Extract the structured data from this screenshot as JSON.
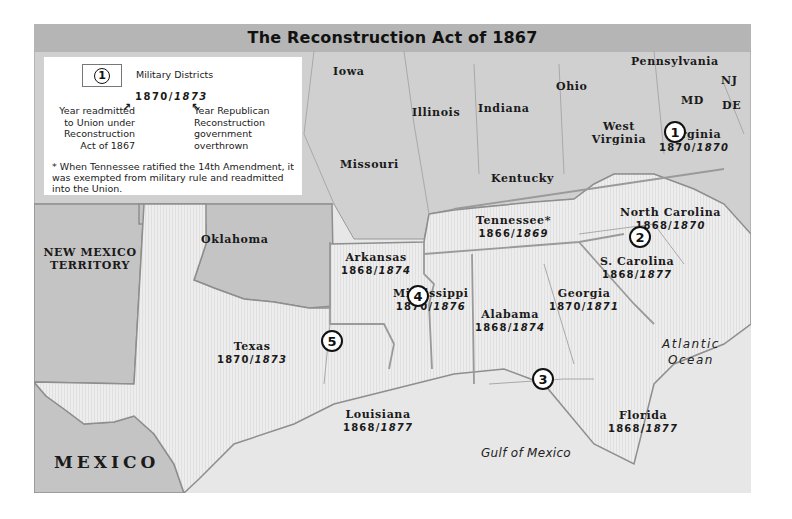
{
  "map": {
    "title": "The Reconstruction Act of 1867",
    "colors": {
      "title_bar": "#b5b5b5",
      "union_states": "#d0d0d0",
      "reconstruction_states": "#ececec",
      "territories_foreign": "#c4c4c4",
      "water": "#e7e7e7",
      "border": "#9a9a9a"
    }
  },
  "legend": {
    "district_symbol": "1",
    "district_label": "Military Districts",
    "sample_years": {
      "readmitted": "1870",
      "separator": "/",
      "overthrown": "1873"
    },
    "left_note": "Year readmitted to Union under Reconstruction Act of 1867",
    "right_note": "Year Republican Reconstruction government overthrown",
    "arrow_left": "↗",
    "arrow_right": "↖",
    "footnote": "* When Tennessee ratified the 14th Amendment, it was exempted from military rule and readmitted into the Union."
  },
  "union_states": [
    {
      "name": "Iowa"
    },
    {
      "name": "Illinois"
    },
    {
      "name": "Indiana"
    },
    {
      "name": "Ohio"
    },
    {
      "name": "Pennsylvania"
    },
    {
      "name": "NJ"
    },
    {
      "name": "MD"
    },
    {
      "name": "DE"
    },
    {
      "name": "West Virginia"
    },
    {
      "name": "Missouri"
    },
    {
      "name": "Kentucky"
    }
  ],
  "territories": [
    {
      "name": "NEW MEXICO TERRITORY"
    },
    {
      "name": "Oklahoma"
    },
    {
      "name": "MEXICO"
    }
  ],
  "reconstruction_states": [
    {
      "name": "Virginia",
      "readmitted": "1870",
      "overthrown": "1870"
    },
    {
      "name": "North Carolina",
      "readmitted": "1868",
      "overthrown": "1870"
    },
    {
      "name": "S. Carolina",
      "readmitted": "1868",
      "overthrown": "1877"
    },
    {
      "name": "Tennessee*",
      "readmitted": "1866",
      "overthrown": "1869"
    },
    {
      "name": "Georgia",
      "readmitted": "1870",
      "overthrown": "1871"
    },
    {
      "name": "Alabama",
      "readmitted": "1868",
      "overthrown": "1874"
    },
    {
      "name": "Mississippi",
      "readmitted": "1870",
      "overthrown": "1876"
    },
    {
      "name": "Arkansas",
      "readmitted": "1868",
      "overthrown": "1874"
    },
    {
      "name": "Texas",
      "readmitted": "1870",
      "overthrown": "1873"
    },
    {
      "name": "Louisiana",
      "readmitted": "1868",
      "overthrown": "1877"
    },
    {
      "name": "Florida",
      "readmitted": "1868",
      "overthrown": "1877"
    }
  ],
  "military_districts": [
    {
      "number": "1",
      "state": "Virginia"
    },
    {
      "number": "2",
      "state": "North Carolina / South Carolina"
    },
    {
      "number": "3",
      "state": "Georgia / Alabama / Florida"
    },
    {
      "number": "4",
      "state": "Mississippi / Arkansas"
    },
    {
      "number": "5",
      "state": "Texas / Louisiana"
    }
  ],
  "water_bodies": [
    {
      "name": "Atlantic Ocean",
      "line1": "Atlantic",
      "line2": "Ocean"
    },
    {
      "name": "Gulf of Mexico"
    }
  ]
}
